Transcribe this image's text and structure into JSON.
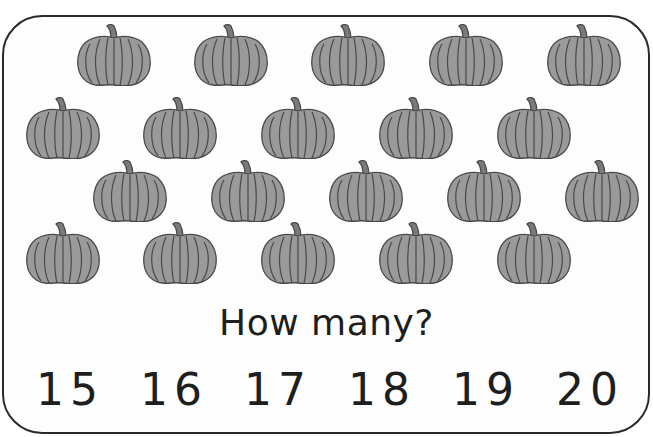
{
  "worksheet": {
    "question": "How many?",
    "pumpkin_count": 20,
    "pumpkin_color": "#9a9a9a",
    "outline_color": "#4a4a4a",
    "choices": [
      "15",
      "16",
      "17",
      "18",
      "19",
      "20"
    ]
  },
  "pumpkins": [
    {
      "x": 76,
      "y": 24
    },
    {
      "x": 193,
      "y": 24
    },
    {
      "x": 310,
      "y": 24
    },
    {
      "x": 428,
      "y": 24
    },
    {
      "x": 546,
      "y": 24
    },
    {
      "x": 25,
      "y": 97
    },
    {
      "x": 142,
      "y": 97
    },
    {
      "x": 260,
      "y": 97
    },
    {
      "x": 378,
      "y": 97
    },
    {
      "x": 496,
      "y": 97
    },
    {
      "x": 92,
      "y": 160
    },
    {
      "x": 210,
      "y": 160
    },
    {
      "x": 328,
      "y": 160
    },
    {
      "x": 446,
      "y": 160
    },
    {
      "x": 564,
      "y": 160
    },
    {
      "x": 25,
      "y": 222
    },
    {
      "x": 142,
      "y": 222
    },
    {
      "x": 260,
      "y": 222
    },
    {
      "x": 378,
      "y": 222
    },
    {
      "x": 496,
      "y": 222
    }
  ]
}
